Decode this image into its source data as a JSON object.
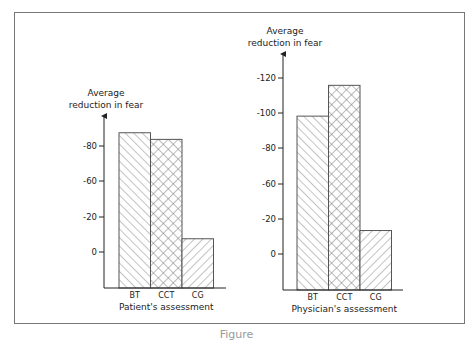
{
  "figure": {
    "caption": "Figure"
  },
  "chart_data": [
    {
      "type": "bar",
      "title": "Patient's assessment",
      "xlabel": "Patient's assessment",
      "ylabel": "Average reduction in fear",
      "ylabel_lines": [
        "Average",
        "reduction in fear"
      ],
      "categories": [
        "BT",
        "CCT",
        "CG"
      ],
      "values": [
        90,
        85,
        10
      ],
      "tick_labels": [
        "-80",
        "-60",
        "-20",
        "0"
      ],
      "patterns": [
        "diagonal-backslash",
        "crosshatch",
        "diagonal-slash"
      ],
      "grid": false
    },
    {
      "type": "bar",
      "title": "Physician's assessment",
      "xlabel": "Physician's assessment",
      "ylabel": "Average reduction in fear",
      "ylabel_lines": [
        "Average",
        "reduction in fear"
      ],
      "categories": [
        "BT",
        "CCT",
        "CG"
      ],
      "values": [
        94,
        115,
        16
      ],
      "tick_labels": [
        "-120",
        "-100",
        "-80",
        "-60",
        "-20",
        "0"
      ],
      "patterns": [
        "diagonal-backslash",
        "crosshatch",
        "diagonal-slash"
      ],
      "grid": false
    }
  ]
}
